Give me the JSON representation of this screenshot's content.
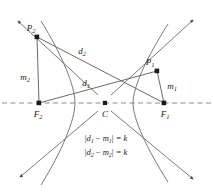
{
  "figure": {
    "colors": {
      "curve": "#5a5a5a",
      "segment": "#5a5a5a",
      "axis": "#7a7a7a",
      "point": "#1a1a1a",
      "text": "#1a1a1a",
      "background": "#ffffff"
    },
    "points": [
      {
        "id": "P2",
        "label": "P",
        "sub": "2",
        "x": 37,
        "y": 37,
        "label_x": 31,
        "label_y": 28
      },
      {
        "id": "P1",
        "label": "P",
        "sub": "1",
        "x": 157,
        "y": 71,
        "label_x": 150,
        "label_y": 62
      },
      {
        "id": "F2",
        "label": "F",
        "sub": "2",
        "x": 39,
        "y": 103,
        "label_x": 38,
        "label_y": 114
      },
      {
        "id": "F1",
        "label": "F",
        "sub": "1",
        "x": 164,
        "y": 103,
        "label_x": 165,
        "label_y": 114
      },
      {
        "id": "C",
        "label": "C",
        "sub": "",
        "x": 105,
        "y": 103,
        "label_x": 105,
        "label_y": 114
      }
    ],
    "segment_labels": [
      {
        "id": "d2",
        "label": "d",
        "sub": "2",
        "x": 82,
        "y": 51
      },
      {
        "id": "d1",
        "label": "d",
        "sub": "1",
        "x": 86,
        "y": 83
      },
      {
        "id": "m2",
        "label": "m",
        "sub": "2",
        "x": 25,
        "y": 77
      },
      {
        "id": "m1",
        "label": "m",
        "sub": "1",
        "x": 172,
        "y": 86
      }
    ],
    "equations": [
      {
        "id": "eq1",
        "lhs_open": "|",
        "a": "d",
        "a_sub": "1",
        "minus": " − ",
        "b": "m",
        "b_sub": "1",
        "lhs_close": "|",
        "rhs": " = k",
        "x": 106,
        "y": 138
      },
      {
        "id": "eq2",
        "lhs_open": "|",
        "a": "d",
        "a_sub": "2",
        "minus": " − ",
        "b": "m",
        "b_sub": "2",
        "lhs_close": "|",
        "rhs": " = k",
        "x": 106,
        "y": 152
      }
    ],
    "axis": {
      "name": "transverse-axis",
      "style": "dashed",
      "y": 103,
      "x_start": 2,
      "x_end": 211
    },
    "asymptotes": [
      {
        "id": "asymptote-upper-left",
        "x1": 96,
        "y1": 93,
        "x2": 16,
        "y2": 19
      },
      {
        "id": "asymptote-upper-right",
        "x1": 113,
        "y1": 93,
        "x2": 195,
        "y2": 18
      },
      {
        "id": "asymptote-lower-left",
        "x1": 96,
        "y1": 113,
        "x2": 18,
        "y2": 179
      },
      {
        "id": "asymptote-lower-right",
        "x1": 113,
        "y1": 113,
        "x2": 195,
        "y2": 181
      }
    ],
    "branches": [
      {
        "id": "branch-left",
        "vertex_x": 75,
        "opens": "left"
      },
      {
        "id": "branch-right",
        "vertex_x": 133,
        "opens": "right"
      }
    ]
  }
}
